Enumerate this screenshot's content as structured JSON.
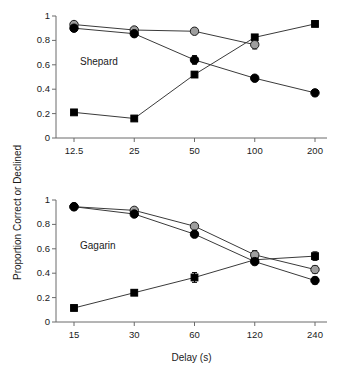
{
  "figure": {
    "ylabel": "Proportion Correct or Declined",
    "xlabel": "Delay (s)"
  },
  "chart_data": [
    {
      "type": "line",
      "title": "Shepard",
      "panel_label": "Shepard",
      "xlabel": "",
      "ylabel": "Proportion Correct or Declined",
      "categories": [
        "12.5",
        "25",
        "50",
        "100",
        "200"
      ],
      "x_tick_labels": [
        "12.5",
        "25",
        "50",
        "100",
        "200"
      ],
      "y_tick_labels": [
        "0",
        "0.2",
        "0.4",
        "0.6",
        "0.8",
        "1"
      ],
      "ylim": [
        0,
        1
      ],
      "grid": false,
      "legend": "none",
      "series": [
        {
          "name": "gray-circle",
          "marker": "circle",
          "color": "#9e9e9e",
          "values": [
            0.93,
            0.885,
            0.875,
            0.765,
            null
          ],
          "errors": [
            0.0,
            0.0,
            0.0,
            0.035,
            null
          ]
        },
        {
          "name": "black-circle",
          "marker": "circle",
          "color": "#000000",
          "values": [
            0.9,
            0.855,
            0.64,
            0.49,
            0.37
          ],
          "errors": [
            0.015,
            0.012,
            0.035,
            0.015,
            0.025
          ]
        },
        {
          "name": "black-square",
          "marker": "square",
          "color": "#000000",
          "values": [
            0.21,
            0.16,
            0.52,
            0.825,
            0.935
          ],
          "errors": [
            0.01,
            0.012,
            0.022,
            0.018,
            0.012
          ]
        }
      ]
    },
    {
      "type": "line",
      "title": "Gagarin",
      "panel_label": "Gagarin",
      "xlabel": "Delay (s)",
      "ylabel": "Proportion Correct or Declined",
      "categories": [
        "15",
        "30",
        "60",
        "120",
        "240"
      ],
      "x_tick_labels": [
        "15",
        "30",
        "60",
        "120",
        "240"
      ],
      "y_tick_labels": [
        "0",
        "0.2",
        "0.4",
        "0.6",
        "0.8",
        "1"
      ],
      "ylim": [
        0,
        1
      ],
      "grid": false,
      "legend": "none",
      "series": [
        {
          "name": "gray-circle",
          "marker": "circle",
          "color": "#9e9e9e",
          "values": [
            0.945,
            0.915,
            0.785,
            0.55,
            0.43
          ],
          "errors": [
            0.008,
            0.012,
            0.022,
            0.035,
            0.03
          ]
        },
        {
          "name": "black-circle",
          "marker": "circle",
          "color": "#000000",
          "values": [
            0.945,
            0.885,
            0.72,
            0.495,
            0.34
          ],
          "errors": [
            0.008,
            0.015,
            0.022,
            0.022,
            0.028
          ]
        },
        {
          "name": "black-square",
          "marker": "square",
          "color": "#000000",
          "values": [
            0.115,
            0.24,
            0.365,
            0.51,
            0.54
          ],
          "errors": [
            0.008,
            0.022,
            0.04,
            0.04,
            0.035
          ]
        }
      ]
    }
  ]
}
